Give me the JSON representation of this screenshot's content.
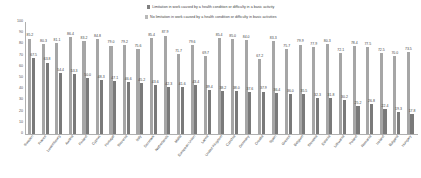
{
  "chart_data": {
    "type": "bar",
    "title": "",
    "xlabel": "",
    "ylabel": "",
    "ylim": [
      0,
      100
    ],
    "grid": false,
    "legend_position": "top",
    "ytick_labels": [
      "100",
      "90",
      "80",
      "70",
      "60",
      "50",
      "40",
      "30",
      "20",
      "10",
      "0"
    ],
    "categories": [
      "Sweden",
      "France",
      "Luxembourg",
      "Austria",
      "Finland",
      "Cyprus",
      "Portugal",
      "Slovenia",
      "Italy",
      "Denmark",
      "Netherlands",
      "Malta",
      "European Union",
      "Latvia",
      "United Kingdom",
      "Czechia",
      "Germany",
      "Croatia",
      "Spain",
      "Greece",
      "Belgium",
      "Slovakia",
      "Estonia",
      "Lithuania",
      "Poland",
      "Romania",
      "Ireland",
      "Bulgaria",
      "Hungary"
    ],
    "series": [
      {
        "name": "No limitation in work caused by a health condition or difficulty in basic activities",
        "color": "#a6a6a6",
        "values": [
          85.2,
          80.3,
          81.1,
          86.4,
          83.2,
          84.8,
          79.0,
          79.2,
          75.6,
          85.4,
          87.9,
          71.7,
          79.6,
          69.7,
          85.4,
          85.0,
          84.0,
          67.2,
          83.3,
          75.7,
          79.9,
          77.9,
          80.3,
          72.1,
          78.4,
          77.5,
          72.5,
          70.0,
          73.5
        ]
      },
      {
        "name": "Limitation in work caused by a health condition or difficulty in a basic activity",
        "color": "#7a7a7a",
        "values": [
          67.5,
          63.8,
          54.4,
          53.3,
          50.0,
          48.3,
          47.1,
          46.6,
          45.2,
          43.6,
          42.3,
          41.6,
          43.4,
          39.4,
          38.2,
          38.0,
          37.6,
          37.9,
          36.4,
          36.0,
          35.5,
          32.3,
          31.8,
          30.2,
          25.2,
          26.8,
          22.4,
          19.3,
          17.8
        ]
      }
    ]
  },
  "legend": {
    "entries": [
      "Limitation in work caused by a health condition or difficulty in a basic activity",
      "No limitation in work caused by a health condition or difficulty in basic activities"
    ]
  }
}
